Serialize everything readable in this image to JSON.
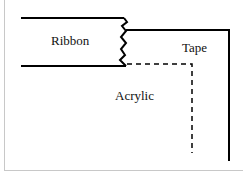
{
  "diagram": {
    "labels": {
      "ribbon": "Ribbon",
      "tape": "Tape",
      "acrylic": "Acrylic"
    },
    "colors": {
      "stroke": "#000000",
      "frame": "#c8c8c8"
    }
  }
}
